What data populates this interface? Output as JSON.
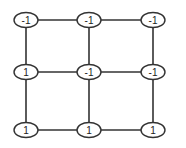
{
  "diagram": {
    "type": "grid-graph",
    "rows": 3,
    "cols": 3,
    "nodes": [
      {
        "id": "n00",
        "row": 0,
        "col": 0,
        "label": "-1",
        "x": 26,
        "y": 20
      },
      {
        "id": "n01",
        "row": 0,
        "col": 1,
        "label": "-1",
        "x": 89,
        "y": 20
      },
      {
        "id": "n02",
        "row": 0,
        "col": 2,
        "label": "-1",
        "x": 153,
        "y": 20
      },
      {
        "id": "n10",
        "row": 1,
        "col": 0,
        "label": "1",
        "x": 26,
        "y": 72
      },
      {
        "id": "n11",
        "row": 1,
        "col": 1,
        "label": "-1",
        "x": 89,
        "y": 72
      },
      {
        "id": "n12",
        "row": 1,
        "col": 2,
        "label": "-1",
        "x": 153,
        "y": 72
      },
      {
        "id": "n20",
        "row": 2,
        "col": 0,
        "label": "1",
        "x": 26,
        "y": 130
      },
      {
        "id": "n21",
        "row": 2,
        "col": 1,
        "label": "1",
        "x": 89,
        "y": 130
      },
      {
        "id": "n22",
        "row": 2,
        "col": 2,
        "label": "1",
        "x": 153,
        "y": 130
      }
    ],
    "edges": [
      [
        "n00",
        "n01"
      ],
      [
        "n01",
        "n02"
      ],
      [
        "n10",
        "n11"
      ],
      [
        "n11",
        "n12"
      ],
      [
        "n20",
        "n21"
      ],
      [
        "n21",
        "n22"
      ],
      [
        "n00",
        "n10"
      ],
      [
        "n10",
        "n20"
      ],
      [
        "n01",
        "n11"
      ],
      [
        "n11",
        "n21"
      ],
      [
        "n02",
        "n12"
      ],
      [
        "n12",
        "n22"
      ]
    ],
    "colors": {
      "stroke": "#333333",
      "node_fill": "#ffffff",
      "text": "#222222"
    }
  }
}
